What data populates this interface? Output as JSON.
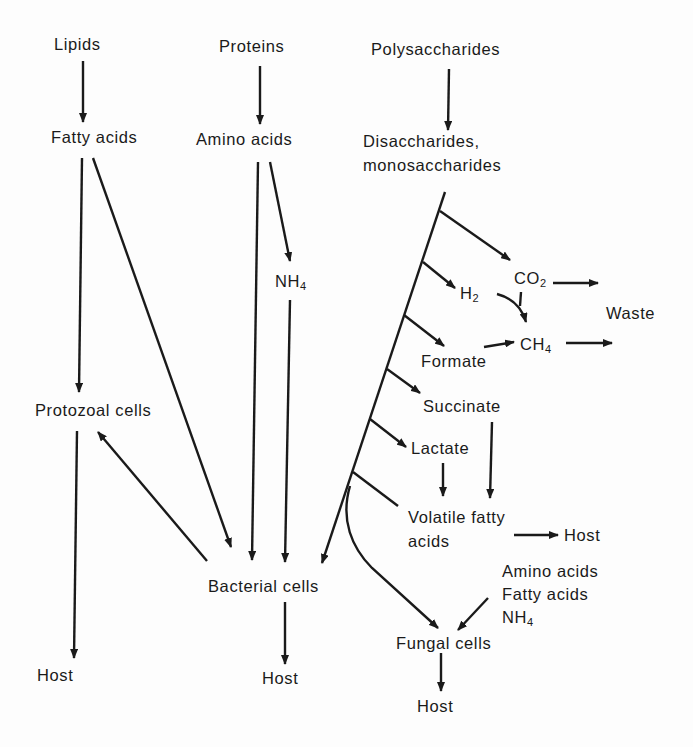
{
  "diagram": {
    "type": "metabolic-flow",
    "ink_color": "#1a1a1a",
    "background": "#fdfdfd",
    "nodes": {
      "lipids": "Lipids",
      "proteins": "Proteins",
      "polysaccharides": "Polysaccharides",
      "fatty_acids": "Fatty acids",
      "amino_acids": "Amino acids",
      "disaccharides_line1": "Disaccharides,",
      "disaccharides_line2": "monosaccharides",
      "nh4": "NH",
      "nh4_sub": "4",
      "co2": "CO",
      "co2_sub": "2",
      "h2": "H",
      "h2_sub": "2",
      "waste": "Waste",
      "formate": "Formate",
      "ch4": "CH",
      "ch4_sub": "4",
      "succinate": "Succinate",
      "protozoal_cells": "Protozoal cells",
      "lactate": "Lactate",
      "vfa_line1": "Volatile fatty",
      "vfa_line2": "acids",
      "host_vfa": "Host",
      "fungal_inputs_line1": "Amino acids",
      "fungal_inputs_line2": "Fatty acids",
      "fungal_inputs_line3": "NH",
      "fungal_inputs_line3_sub": "4",
      "bacterial_cells": "Bacterial cells",
      "fungal_cells": "Fungal cells",
      "host_protozoal": "Host",
      "host_bacterial": "Host",
      "host_fungal": "Host"
    },
    "edges": [
      [
        "Lipids",
        "Fatty acids"
      ],
      [
        "Proteins",
        "Amino acids"
      ],
      [
        "Polysaccharides",
        "Disaccharides, monosaccharides"
      ],
      [
        "Fatty acids",
        "Protozoal cells"
      ],
      [
        "Fatty acids",
        "Bacterial cells"
      ],
      [
        "Amino acids",
        "Bacterial cells"
      ],
      [
        "Amino acids",
        "NH4"
      ],
      [
        "NH4",
        "Bacterial cells"
      ],
      [
        "Disaccharides, monosaccharides",
        "CO2"
      ],
      [
        "Disaccharides, monosaccharides",
        "H2"
      ],
      [
        "Disaccharides, monosaccharides",
        "Formate"
      ],
      [
        "Disaccharides, monosaccharides",
        "Succinate"
      ],
      [
        "Disaccharides, monosaccharides",
        "Lactate"
      ],
      [
        "Disaccharides, monosaccharides",
        "Volatile fatty acids"
      ],
      [
        "Disaccharides, monosaccharides",
        "Bacterial cells"
      ],
      [
        "Disaccharides, monosaccharides",
        "Fungal cells"
      ],
      [
        "CO2",
        "Waste"
      ],
      [
        "H2",
        "CH4"
      ],
      [
        "CO2",
        "CH4"
      ],
      [
        "Formate",
        "CH4"
      ],
      [
        "CH4",
        "Waste"
      ],
      [
        "Succinate",
        "Volatile fatty acids"
      ],
      [
        "Lactate",
        "Volatile fatty acids"
      ],
      [
        "Volatile fatty acids",
        "Host"
      ],
      [
        "Bacterial cells",
        "Protozoal cells"
      ],
      [
        "Amino acids, Fatty acids, NH4",
        "Fungal cells"
      ],
      [
        "Protozoal cells",
        "Host"
      ],
      [
        "Bacterial cells",
        "Host"
      ],
      [
        "Fungal cells",
        "Host"
      ]
    ]
  }
}
